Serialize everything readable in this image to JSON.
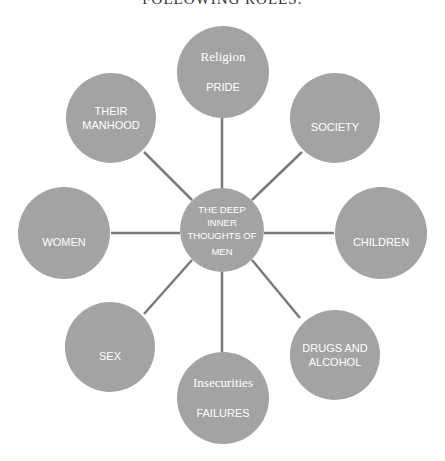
{
  "header": {
    "text": "FOLLOWING ROLES:"
  },
  "diagram": {
    "center": {
      "lines": [
        "THE DEEP",
        "INNER",
        "THOUGHTS OF",
        "MEN"
      ]
    },
    "nodes": [
      {
        "id": "top",
        "title": "Religion",
        "label": "PRIDE"
      },
      {
        "id": "top-right",
        "label": "SOCIETY"
      },
      {
        "id": "right",
        "label": "CHILDREN"
      },
      {
        "id": "bottom-right",
        "label": "DRUGS AND\nALCOHOL",
        "line1": "DRUGS AND",
        "line2": "ALCOHOL"
      },
      {
        "id": "bottom",
        "title": "Insecurities",
        "label": "FAILURES"
      },
      {
        "id": "bottom-left",
        "label": "SEX"
      },
      {
        "id": "left",
        "label": "WOMEN"
      },
      {
        "id": "top-left",
        "label": "THEIR\nMANHOOD",
        "line1": "THEIR",
        "line2": "MANHOOD"
      }
    ],
    "colors": {
      "circle": "#a3a3a3",
      "connector": "#7a7a7a",
      "text": "#ffffff"
    }
  }
}
